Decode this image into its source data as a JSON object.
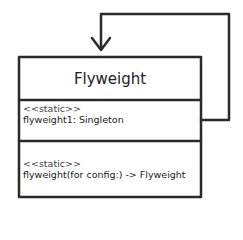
{
  "diagram": {
    "type": "UML class diagram (self-association)",
    "class": {
      "name": "Flyweight",
      "attributes": [
        {
          "stereotype": "<<static>>",
          "text": "flyweight1: Singleton"
        }
      ],
      "methods": [
        {
          "stereotype": "<<static>>",
          "text": "flyweight(for config:) -> Flyweight"
        }
      ]
    },
    "relationship": {
      "from": "Flyweight.attributes",
      "to": "Flyweight",
      "arrow": "open-arrow-down"
    },
    "colors": {
      "stroke": "#2a2a2a",
      "background": "#ffffff",
      "text": "#222222"
    }
  }
}
